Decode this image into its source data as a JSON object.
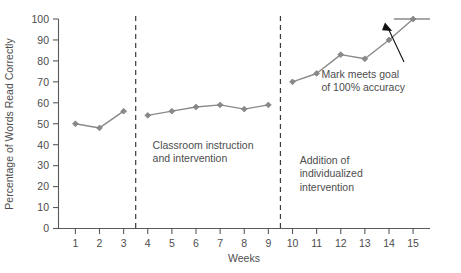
{
  "chart_data": {
    "type": "line",
    "title": "",
    "xlabel": "Weeks",
    "ylabel": "Percentage of Words Read Correctly",
    "xlim": [
      0.3,
      15.7
    ],
    "ylim": [
      0,
      100
    ],
    "grid": false,
    "legend": "none",
    "x": [
      1,
      2,
      3,
      4,
      5,
      6,
      7,
      8,
      9,
      10,
      11,
      12,
      13,
      14,
      15
    ],
    "xtick_labels": [
      "1",
      "2",
      "3",
      "4",
      "5",
      "6",
      "7",
      "8",
      "9",
      "10",
      "11",
      "12",
      "13",
      "14",
      "15"
    ],
    "ytick_labels": [
      "0",
      "10",
      "20",
      "30",
      "40",
      "50",
      "60",
      "70",
      "80",
      "90",
      "100"
    ],
    "yticks": [
      0,
      10,
      20,
      30,
      40,
      50,
      60,
      70,
      80,
      90,
      100
    ],
    "series": [
      {
        "name": "Baseline",
        "x": [
          1,
          2,
          3
        ],
        "values": [
          50,
          48,
          56
        ]
      },
      {
        "name": "Classroom instruction and intervention",
        "x": [
          4,
          5,
          6,
          7,
          8,
          9
        ],
        "values": [
          54,
          56,
          58,
          59,
          57,
          59
        ]
      },
      {
        "name": "Addition of individualized intervention",
        "x": [
          10,
          11,
          12,
          13,
          14,
          15
        ],
        "values": [
          70,
          74,
          83,
          81,
          90,
          100
        ]
      }
    ],
    "goal_line": {
      "label": "goal-line",
      "value": 100,
      "x_start": 14.2,
      "x_end": 15.7
    },
    "phase_dividers": [
      {
        "label": "phase-divider-1",
        "x": 3.5
      },
      {
        "label": "phase-divider-2",
        "x": 9.5
      }
    ],
    "annotations": [
      {
        "name": "phase-label-classroom",
        "lines": [
          "Classroom instruction",
          "and intervention"
        ],
        "x": 4.2,
        "y": 38
      },
      {
        "name": "phase-label-individualized",
        "lines": [
          "Addition of",
          "individualized",
          "intervention"
        ],
        "x": 10.3,
        "y": 31
      },
      {
        "name": "callout-goal-met",
        "lines": [
          "Mark meets goal",
          "of 100% accuracy"
        ],
        "x": 11.2,
        "y": 72
      }
    ],
    "colors": {
      "line": "#8a8a8c",
      "marker": "#8a8a8c",
      "axis": "#59595b",
      "text": "#4d4d4d",
      "divider": "#3a3a3a",
      "callout": "#111111",
      "background": "#ffffff"
    }
  }
}
